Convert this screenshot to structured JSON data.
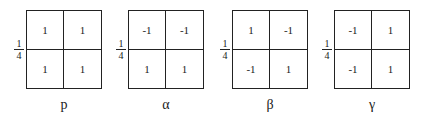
{
  "diagram": {
    "fraction": {
      "numerator": "1",
      "denominator": "4"
    },
    "panels": [
      {
        "label": "p",
        "cells": [
          "1",
          "1",
          "1",
          "1"
        ]
      },
      {
        "label": "α",
        "cells": [
          "-1",
          "-1",
          "1",
          "1"
        ]
      },
      {
        "label": "β",
        "cells": [
          "1",
          "-1",
          "-1",
          "1"
        ]
      },
      {
        "label": "γ",
        "cells": [
          "-1",
          "1",
          "-1",
          "1"
        ]
      }
    ]
  }
}
